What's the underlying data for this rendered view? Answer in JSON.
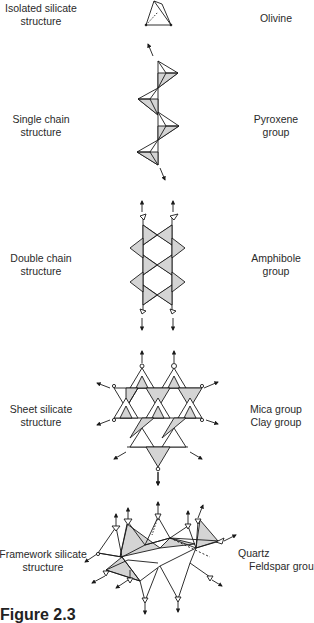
{
  "figure": {
    "caption": "Figure 2.3",
    "rows": [
      {
        "structure": [
          "Isolated silicate",
          "structure"
        ],
        "mineral": [
          "Olivine"
        ]
      },
      {
        "structure": [
          "Single chain",
          "structure"
        ],
        "mineral": [
          "Pyroxene",
          "group"
        ]
      },
      {
        "structure": [
          "Double chain",
          "structure"
        ],
        "mineral": [
          "Amphibole",
          "group"
        ]
      },
      {
        "structure": [
          "Sheet silicate",
          "structure"
        ],
        "mineral": [
          "Mica group",
          "Clay group"
        ]
      },
      {
        "structure": [
          "Framework silicate",
          "structure"
        ],
        "mineral": [
          "Quartz",
          "Feldspar group"
        ]
      }
    ],
    "colors": {
      "line": "#1a1a1a",
      "fill": "#d4d4d4",
      "background": "#ffffff"
    }
  }
}
